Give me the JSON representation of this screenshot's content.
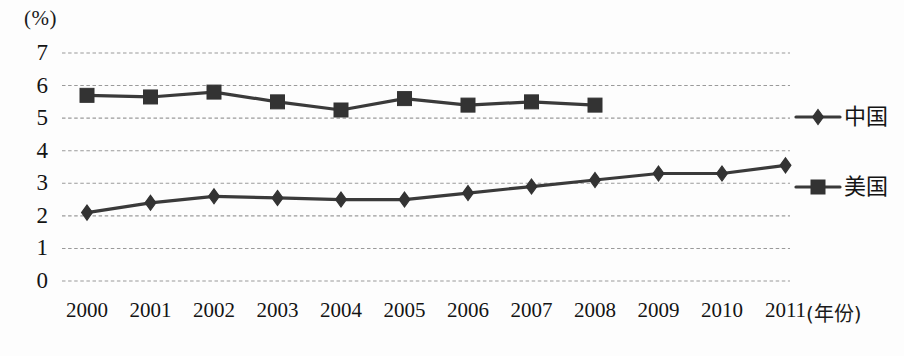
{
  "axis": {
    "y_unit_label": "(%)",
    "x_title": "(年份)",
    "y_ticks": [
      "7",
      "6",
      "5",
      "4",
      "3",
      "2",
      "1",
      "0"
    ],
    "x_ticks": [
      "2000",
      "2001",
      "2002",
      "2003",
      "2004",
      "2005",
      "2006",
      "2007",
      "2008",
      "2009",
      "2010",
      "2011"
    ]
  },
  "legend": {
    "china_label": "中国",
    "usa_label": "美国",
    "china_marker": "diamond-marker",
    "usa_marker": "square-marker"
  },
  "colors": {
    "line": "#3a3a3a",
    "marker": "#333333",
    "gridline": "#9a9a9a",
    "text": "#141414",
    "background": "#fdfdfd"
  },
  "chart_data": {
    "type": "line",
    "title": "",
    "xlabel": "(年份)",
    "ylabel": "(%)",
    "ylim": [
      0,
      7
    ],
    "grid": true,
    "legend_position": "right",
    "categories": [
      "2000",
      "2001",
      "2002",
      "2003",
      "2004",
      "2005",
      "2006",
      "2007",
      "2008",
      "2009",
      "2010",
      "2011"
    ],
    "series": [
      {
        "name": "美国",
        "marker": "square",
        "values": [
          5.7,
          5.65,
          5.8,
          5.5,
          5.25,
          5.6,
          5.4,
          5.5,
          5.4,
          null,
          null,
          null
        ]
      },
      {
        "name": "中国",
        "marker": "diamond",
        "values": [
          2.1,
          2.4,
          2.6,
          2.55,
          2.5,
          2.5,
          2.7,
          2.9,
          3.1,
          3.3,
          3.3,
          3.55
        ]
      }
    ]
  }
}
